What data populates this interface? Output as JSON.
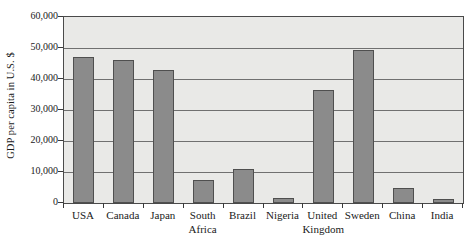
{
  "chart_data": {
    "type": "bar",
    "title": "",
    "subtitle": "",
    "xlabel": "",
    "ylabel": "GDP per capita in U.S. $",
    "categories": [
      "USA",
      "Canada",
      "Japan",
      "South Africa",
      "Brazil",
      "Nigeria",
      "United Kingdom",
      "Sweden",
      "China",
      "India"
    ],
    "category_lines": [
      [
        "USA",
        ""
      ],
      [
        "Canada",
        ""
      ],
      [
        "Japan",
        ""
      ],
      [
        "South",
        "Africa"
      ],
      [
        "Brazil",
        ""
      ],
      [
        "Nigeria",
        ""
      ],
      [
        "United",
        "Kingdom"
      ],
      [
        "Sweden",
        ""
      ],
      [
        "China",
        ""
      ],
      [
        "India",
        ""
      ]
    ],
    "values": [
      47000,
      46200,
      43000,
      7500,
      11000,
      1500,
      36500,
      49500,
      5000,
      1400
    ],
    "ylim": [
      0,
      60000
    ],
    "ytick_values": [
      0,
      10000,
      20000,
      30000,
      40000,
      50000,
      60000
    ],
    "ytick_labels": [
      "0",
      "10,000",
      "20,000",
      "30,000",
      "40,000",
      "50,000",
      "60,000"
    ],
    "grid": "horizontal",
    "legend": "none",
    "legend_entries": [],
    "annotations": [],
    "colors": {
      "bar_fill": "#8b8b8b",
      "bar_edge": "#4f4f4f",
      "plot_background": "#e9e9e7",
      "gridline": "#707070",
      "axis": "#4a4a4a",
      "text": "#1a1a1a",
      "figure_background": "#ffffff"
    }
  }
}
